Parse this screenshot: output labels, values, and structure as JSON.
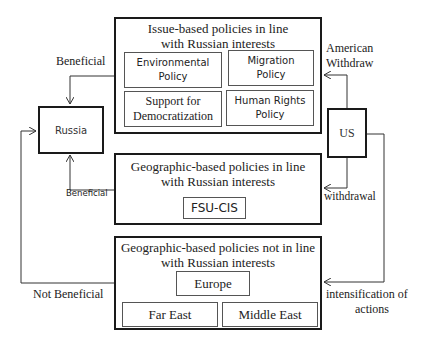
{
  "nodes": {
    "russia": {
      "label": "Russia"
    },
    "us": {
      "label": "US"
    },
    "issue_box": {
      "title_line1": "Issue-based policies in line",
      "title_line2": "with Russian interests",
      "items": [
        {
          "line1": "Environmental",
          "line2": "Policy"
        },
        {
          "line1": "Migration",
          "line2": "Policy"
        },
        {
          "line1": "Support for",
          "line2": "Democratization"
        },
        {
          "line1": "Human Rights",
          "line2": "Policy"
        }
      ]
    },
    "geo_in_line_box": {
      "title_line1": "Geographic-based policies in line",
      "title_line2": "with Russian interests",
      "items": [
        {
          "label": "FSU-CIS"
        }
      ]
    },
    "geo_not_in_line_box": {
      "title_line1": "Geographic-based policies not in line",
      "title_line2": "with Russian interests",
      "items": [
        {
          "label": "Europe"
        },
        {
          "label": "Far East"
        },
        {
          "label": "Middle East"
        }
      ]
    }
  },
  "edges": {
    "issue_to_russia": {
      "label": "Beneficial"
    },
    "geo_in_line_to_russia": {
      "label": "Beneficial"
    },
    "geo_not_in_line_to_russia": {
      "label": "Not Beneficial"
    },
    "us_to_issue": {
      "label_line1": "American",
      "label_line2": "Withdraw"
    },
    "us_to_geo_in_line": {
      "label": "withdrawal"
    },
    "us_to_geo_not_in_line": {
      "label_line1": "intensification of",
      "label_line2": "actions"
    }
  },
  "colors": {
    "line": "#1a1a1a",
    "text": "#222222",
    "background": "#ffffff"
  }
}
